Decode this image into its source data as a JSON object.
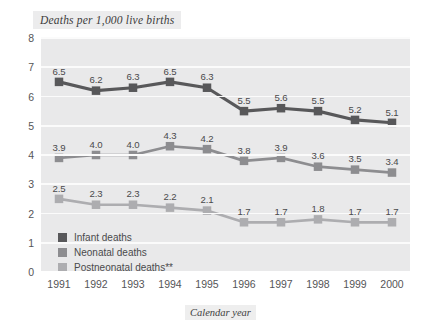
{
  "chart_data": {
    "type": "line",
    "title": "Deaths per 1,000 live births",
    "xlabel": "Calendar year",
    "ylabel": "",
    "categories": [
      "1991",
      "1992",
      "1993",
      "1994",
      "1995",
      "1996",
      "1997",
      "1998",
      "1999",
      "2000"
    ],
    "ylim": [
      0,
      8
    ],
    "yticks": [
      "0",
      "1",
      "2",
      "3",
      "4",
      "5",
      "6",
      "7",
      "8"
    ],
    "grid": true,
    "legend_position": "inside-bottom-left",
    "series": [
      {
        "name": "Infant deaths",
        "color": "#58585a",
        "values": [
          6.5,
          6.2,
          6.3,
          6.5,
          6.3,
          5.5,
          5.6,
          5.5,
          5.2,
          5.1
        ],
        "labels": [
          "6.5",
          "6.2",
          "6.3",
          "6.5",
          "6.3",
          "5.5",
          "5.6",
          "5.5",
          "5.2",
          "5.1"
        ]
      },
      {
        "name": "Neonatal deaths",
        "color": "#8d8d90",
        "values": [
          3.9,
          4.0,
          4.0,
          4.3,
          4.2,
          3.8,
          3.9,
          3.6,
          3.5,
          3.4
        ],
        "labels": [
          "3.9",
          "4.0",
          "4.0",
          "4.3",
          "4.2",
          "3.8",
          "3.9",
          "3.6",
          "3.5",
          "3.4"
        ]
      },
      {
        "name": "Postneonatal deaths**",
        "color": "#adadb0",
        "values": [
          2.5,
          2.3,
          2.3,
          2.2,
          2.1,
          1.7,
          1.7,
          1.8,
          1.7,
          1.7
        ],
        "labels": [
          "2.5",
          "2.3",
          "2.3",
          "2.2",
          "2.1",
          "1.7",
          "1.7",
          "1.8",
          "1.7",
          "1.7"
        ]
      }
    ]
  },
  "colors": {
    "plot_background": "#e9e9ea",
    "gridline": "#fbfbfb",
    "title_background": "#ececed",
    "text": "#4a4a4c"
  }
}
